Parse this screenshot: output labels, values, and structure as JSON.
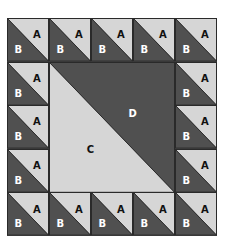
{
  "diagram": {
    "type": "quilt-block",
    "grid": {
      "columns": 5,
      "rows": 5
    },
    "colors": {
      "light": "#d6d6d6",
      "dark": "#505050",
      "line": "#2a2a2a",
      "label_dark": "#111111",
      "label_light": "#ffffff"
    },
    "border_units": {
      "light_triangle_label": "A",
      "dark_triangle_label": "B",
      "count": 16
    },
    "center": {
      "light_triangle_label": "C",
      "dark_triangle_label": "D"
    }
  }
}
